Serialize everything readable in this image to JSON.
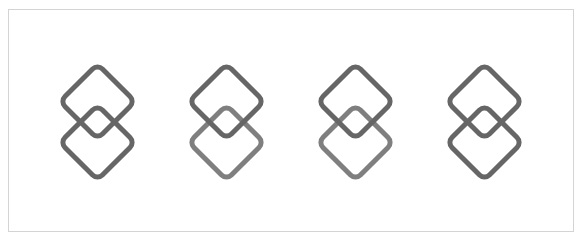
{
  "colors": {
    "background": "#ffffff",
    "frame_border": "#d4d4d4",
    "stroke_dark": "#666666",
    "stroke_light": "#7f7f7f"
  },
  "icons": [
    {
      "name": "interlocking-diamonds-icon-1",
      "upper": "stroke_dark",
      "lower": "stroke_dark"
    },
    {
      "name": "interlocking-diamonds-icon-2",
      "upper": "stroke_dark",
      "lower": "stroke_light"
    },
    {
      "name": "interlocking-diamonds-icon-3",
      "upper": "stroke_dark",
      "lower": "stroke_light"
    },
    {
      "name": "interlocking-diamonds-icon-4",
      "upper": "stroke_dark",
      "lower": "stroke_dark"
    }
  ]
}
